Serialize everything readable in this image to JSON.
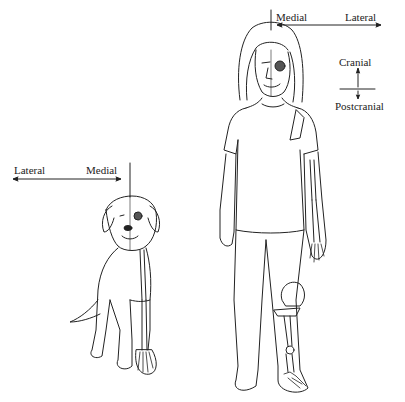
{
  "human": {
    "medial_label": "Medial",
    "lateral_label": "Lateral",
    "cranial_label": "Cranial",
    "postcranial_label": "Postcranial"
  },
  "dog": {
    "lateral_label": "Lateral",
    "medial_label": "Medial"
  },
  "colors": {
    "line": "#222222",
    "background": "#ffffff"
  }
}
